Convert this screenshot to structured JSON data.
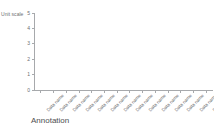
{
  "chart_data": {
    "type": "bar",
    "title": "",
    "subtitle": "",
    "xlabel": "",
    "ylabel": "Unit scale",
    "ylim": [
      0,
      5
    ],
    "yticks": [
      "0",
      "1",
      "2",
      "3",
      "4",
      "5"
    ],
    "grid": false,
    "legend": null,
    "categories": [
      "Data name",
      "Data name",
      "Data name",
      "Data name",
      "Data name",
      "Data name",
      "Data name",
      "Data name",
      "Data name",
      "Data name",
      "Data name",
      "Data name",
      "Data name",
      "Data name"
    ],
    "values": [
      0,
      0,
      0,
      0,
      0,
      0,
      0,
      0,
      0,
      0,
      0,
      0,
      0,
      0
    ],
    "annotation": "Annotation"
  },
  "colors": {
    "background": "#ffffff",
    "axis": "#a7a9ac",
    "tick_text": "#6d6e71",
    "annotation_text": "#4d4d4f"
  }
}
